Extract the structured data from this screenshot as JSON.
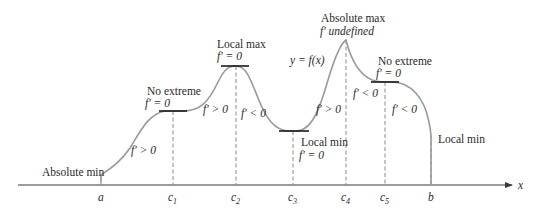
{
  "diagram": {
    "type": "calculus-extrema-graph",
    "curve_label": "y = f(x)",
    "axis": {
      "x_label": "x"
    },
    "tick_labels": [
      {
        "id": "a",
        "text": "a"
      },
      {
        "id": "c1",
        "text": "c",
        "sub": "1"
      },
      {
        "id": "c2",
        "text": "c",
        "sub": "2"
      },
      {
        "id": "c3",
        "text": "c",
        "sub": "3"
      },
      {
        "id": "c4",
        "text": "c",
        "sub": "4"
      },
      {
        "id": "c5",
        "text": "c",
        "sub": "5"
      },
      {
        "id": "b",
        "text": "b"
      }
    ],
    "points": {
      "a": {
        "title": "Absolute min"
      },
      "c1": {
        "title": "No extreme",
        "derivative": "f′ = 0"
      },
      "c2": {
        "title": "Local max",
        "derivative": "f′ = 0"
      },
      "c3": {
        "title": "Local min",
        "derivative": "f′ = 0"
      },
      "c4": {
        "title": "Absolute max",
        "derivative": "f′ undefined"
      },
      "c5": {
        "title": "No extreme",
        "derivative": "f′ = 0"
      },
      "b": {
        "title": "Local min"
      }
    },
    "intervals": [
      {
        "id": "a-c1",
        "text": "f′ > 0"
      },
      {
        "id": "c1-c2",
        "text": "f′ > 0"
      },
      {
        "id": "c2-c3",
        "text": "f′ < 0"
      },
      {
        "id": "c3-c4",
        "text": "f′ > 0"
      },
      {
        "id": "c4-c5",
        "text": "f′ < 0"
      },
      {
        "id": "c5-b",
        "text": "f′ < 0"
      }
    ]
  }
}
